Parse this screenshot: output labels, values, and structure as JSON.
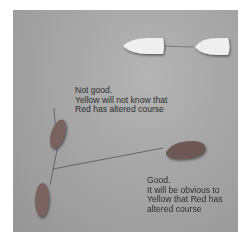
{
  "diagram": {
    "boats": [
      {
        "id": "boat-white-left",
        "color": "#efefef"
      },
      {
        "id": "boat-white-right",
        "color": "#efefef"
      },
      {
        "id": "boat-red-upper",
        "color": "#7a6260"
      },
      {
        "id": "boat-red-lower",
        "color": "#7a6260"
      },
      {
        "id": "boat-red-right",
        "color": "#6e5856"
      }
    ],
    "annotations": {
      "bad": {
        "lines": [
          "Not good.",
          "Yellow will not know that",
          "Red has altered course"
        ]
      },
      "good": {
        "lines": [
          "Good.",
          "It will be obvious to",
          "Yellow that Red has",
          "altered course"
        ]
      }
    },
    "colors": {
      "background": "#a8a8a8",
      "text": "#2e2e2e",
      "line": "#4a4a4a"
    }
  }
}
